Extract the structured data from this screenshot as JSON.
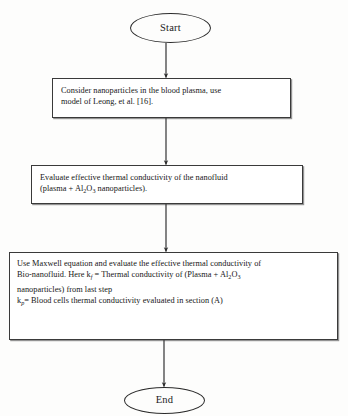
{
  "diagram": {
    "background_color": "#fdfdfc",
    "stroke_color": "#2b2b2b",
    "nodes": {
      "start": {
        "shape": "ellipse",
        "label": "Start"
      },
      "step_1": {
        "shape": "rectangle",
        "text_line_1": "Consider nanoparticles in the blood plasma, use",
        "text_line_2": "model of Leong, et al. [16].",
        "citation": "[16]"
      },
      "step_2": {
        "shape": "rectangle",
        "text_line_1": "Evaluate effective thermal conductivity of the nanofluid",
        "text_line_2_a": "(plasma + Al",
        "text_line_2_sub_1": "2",
        "text_line_2_b": "O",
        "text_line_2_sub_2": "3",
        "text_line_2_c": " nanoparticles)."
      },
      "step_3": {
        "shape": "rectangle",
        "line_1": "Use Maxwell equation and evaluate the effective thermal conductivity of",
        "line_2_a": "Bio-nanofluid. Here k",
        "line_2_sub": "f",
        "line_2_b": " = Thermal conductivity of (Plasma + Al",
        "line_2_sub_2": "2",
        "line_2_c": "O",
        "line_2_sub_3": "3",
        "line_3": "nanoparticles) from last step",
        "line_4_a": "k",
        "line_4_sub": "p",
        "line_4_b": "=  Blood cells thermal conductivity evaluated in section (A)"
      },
      "end": {
        "shape": "ellipse",
        "label": "End"
      }
    },
    "connectors": [
      {
        "from": "start",
        "to": "step_1",
        "arrowhead": true
      },
      {
        "from": "step_1",
        "to": "step_2",
        "arrowhead": true
      },
      {
        "from": "step_2",
        "to": "step_3",
        "arrowhead": true
      },
      {
        "from": "step_3",
        "to": "end",
        "arrowhead": true
      }
    ]
  }
}
